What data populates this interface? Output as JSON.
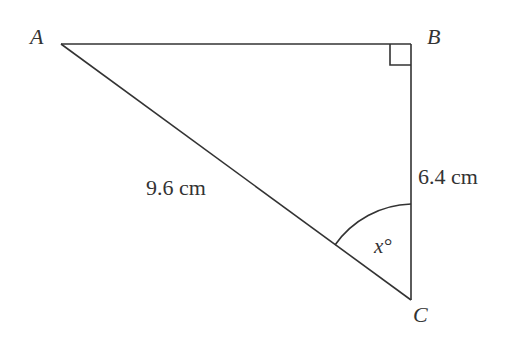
{
  "diagram": {
    "type": "right-triangle",
    "vertices": {
      "A": {
        "label": "A"
      },
      "B": {
        "label": "B"
      },
      "C": {
        "label": "C"
      }
    },
    "right_angle_at": "B",
    "sides": {
      "AC": {
        "label": "9.6 cm"
      },
      "BC": {
        "label": "6.4 cm"
      }
    },
    "angle": {
      "vertex": "C",
      "label": "x°"
    },
    "stroke_color": "#333333"
  }
}
